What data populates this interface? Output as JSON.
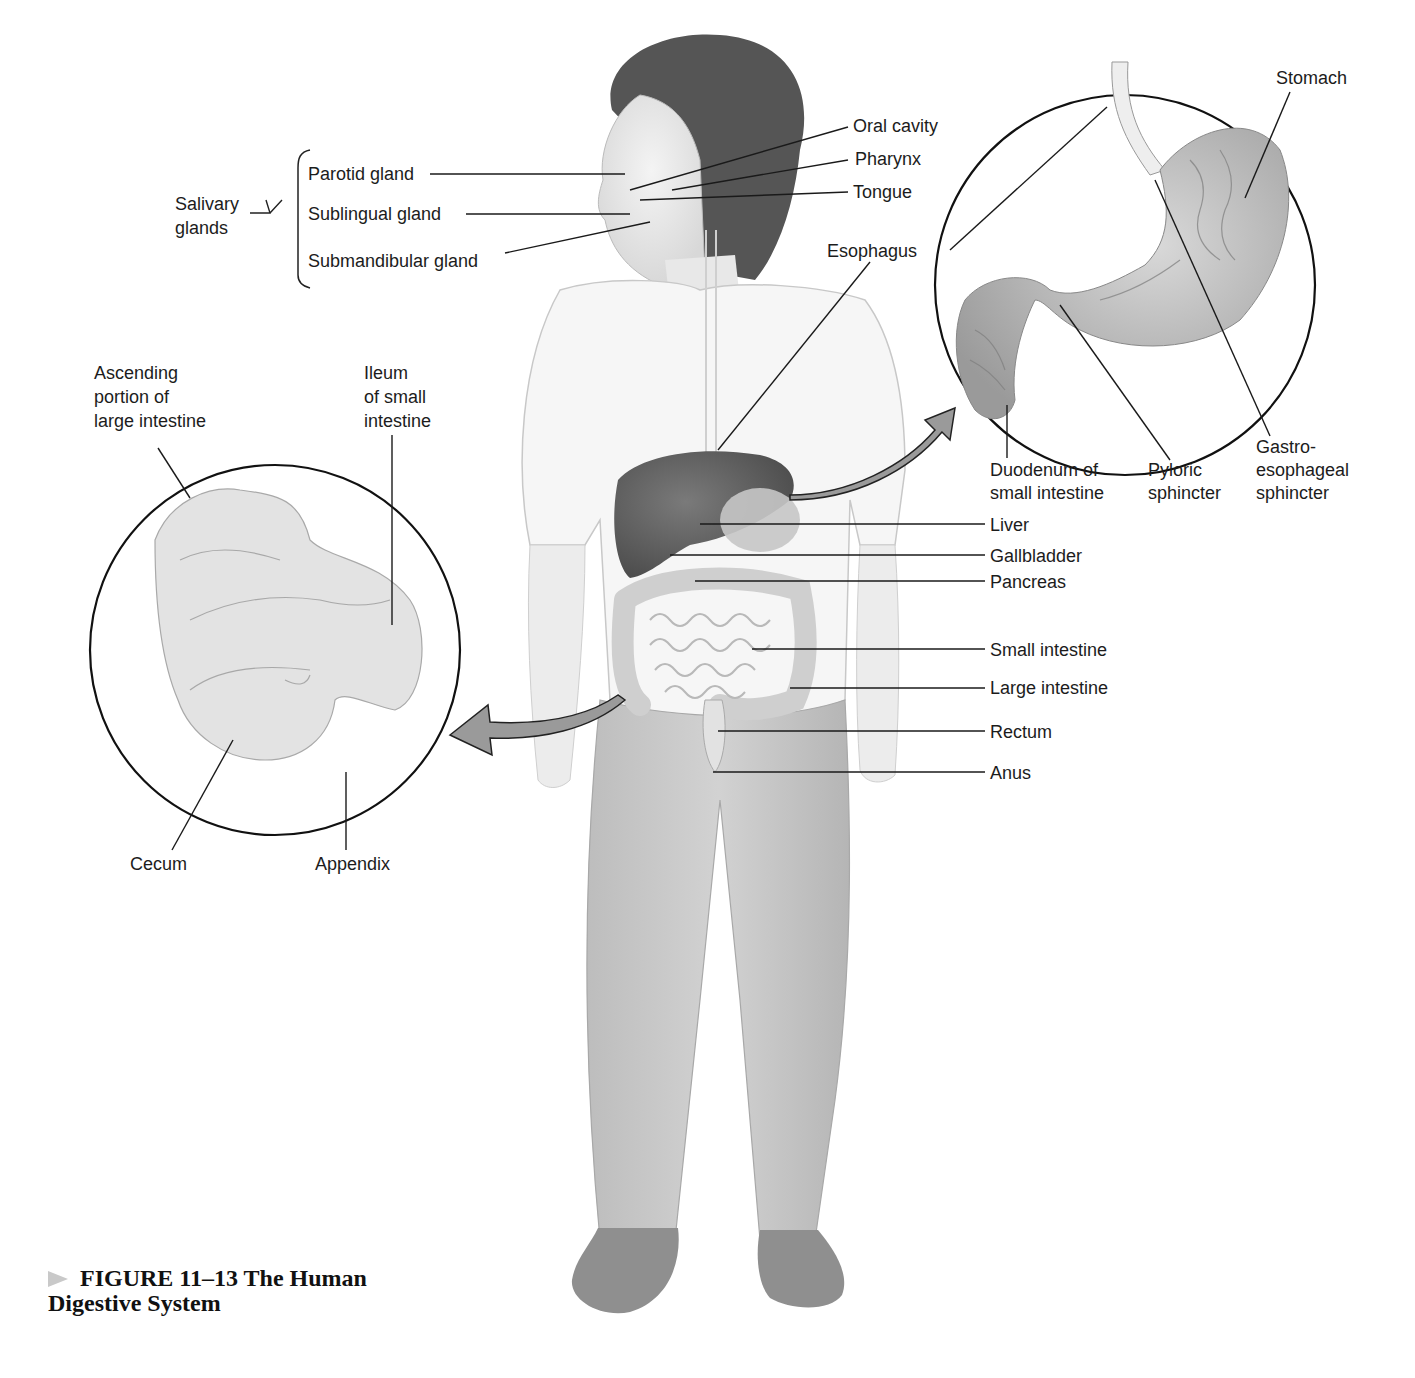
{
  "figure": {
    "caption_prefix": "FIGURE 11–13",
    "caption_title": "The Human Digestive System",
    "caption_line1": "FIGURE 11–13 The Human",
    "caption_line2": "Digestive System"
  },
  "salivary": {
    "group_label_1": "Salivary",
    "group_label_2": "glands",
    "glands": [
      "Parotid gland",
      "Sublingual gland",
      "Submandibular gland"
    ]
  },
  "head_labels": [
    "Oral cavity",
    "Pharynx",
    "Tongue",
    "Esophagus"
  ],
  "stomach_inset": {
    "labels": {
      "stomach": "Stomach",
      "duodenum_1": "Duodenum of",
      "duodenum_2": "small intestine",
      "pyloric_1": "Pyloric",
      "pyloric_2": "sphincter",
      "gastro_1": "Gastro-",
      "gastro_2": "esophageal",
      "gastro_3": "sphincter"
    }
  },
  "intestine_inset": {
    "labels": {
      "ascending_1": "Ascending",
      "ascending_2": "portion of",
      "ascending_3": "large intestine",
      "ileum_1": "Ileum",
      "ileum_2": "of small",
      "ileum_3": "intestine",
      "cecum": "Cecum",
      "appendix": "Appendix"
    }
  },
  "body_labels": [
    "Liver",
    "Gallbladder",
    "Pancreas",
    "Small intestine",
    "Large intestine",
    "Rectum",
    "Anus"
  ]
}
